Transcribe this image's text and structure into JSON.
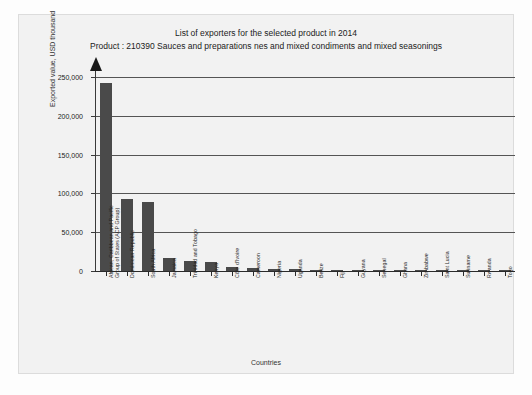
{
  "chart_data": {
    "type": "bar",
    "title": "List of exporters for the selected product in 2014",
    "subtitle": "Product : 210390 Sauces and preparations nes and mixed condiments and mixed seasonings",
    "xlabel": "Countries",
    "ylabel": "Exported value, USD thousand",
    "ylim": [
      0,
      250000
    ],
    "ytick_labels": [
      "0",
      "50,000",
      "100,000",
      "150,000",
      "200,000",
      "250,000"
    ],
    "ytick_values": [
      0,
      50000,
      100000,
      150000,
      200000,
      250000
    ],
    "grid": true,
    "legend": "none",
    "bar_color": "#4a4a4a",
    "categories": [
      "African, Caribbean and Pacific Group of States (ACP Group)",
      "Dominican Republic",
      "South Africa",
      "Jamaica",
      "Trinidad and Tobago",
      "Kenya",
      "Côte d'Ivoire",
      "Cameroon",
      "Nigeria",
      "Uganda",
      "Belize",
      "Fiji",
      "Guyana",
      "Senegal",
      "Ghana",
      "Zimbabwe",
      "Saint Lucia",
      "Suriname",
      "Rwanda",
      "Togo"
    ],
    "values": [
      242000,
      93000,
      89000,
      17000,
      13000,
      12000,
      5000,
      3500,
      2500,
      2000,
      1600,
      1300,
      1100,
      900,
      800,
      700,
      600,
      500,
      400,
      300
    ]
  }
}
